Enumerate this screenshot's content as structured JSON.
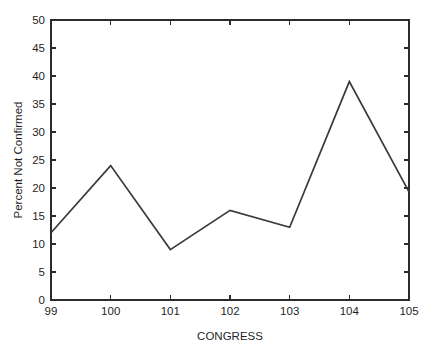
{
  "chart_data": {
    "type": "line",
    "title": "",
    "subtitle": "",
    "xlabel": "CONGRESS",
    "ylabel": "Percent Not Confirmed",
    "x": [
      99,
      100,
      101,
      102,
      103,
      104,
      105
    ],
    "values": [
      12,
      24,
      9,
      16,
      13,
      39,
      19.3
    ],
    "categories": [
      "99",
      "100",
      "101",
      "102",
      "103",
      "104",
      "105"
    ],
    "series": [
      {
        "name": "Percent Not Confirmed",
        "values": [
          12,
          24,
          9,
          16,
          13,
          39,
          19.3
        ]
      }
    ],
    "xlim": [
      99,
      105
    ],
    "ylim": [
      0,
      50
    ],
    "x_ticks": [
      99,
      100,
      101,
      102,
      103,
      104,
      105
    ],
    "x_tick_labels": [
      "99",
      "100",
      "101",
      "102",
      "103",
      "104",
      "105"
    ],
    "y_ticks": [
      0,
      5,
      10,
      15,
      20,
      25,
      30,
      35,
      40,
      45,
      50
    ],
    "y_tick_labels": [
      "0",
      "5",
      "10",
      "15",
      "20",
      "25",
      "30",
      "35",
      "40",
      "45",
      "50"
    ],
    "grid": false,
    "legend": false,
    "legend_position": "none",
    "line_color": "#3a3a3a",
    "axis_color": "#2b2b2b",
    "background_color": "#ffffff",
    "annotations": []
  },
  "axis": {
    "x_title": "CONGRESS",
    "y_title": "Percent Not Confirmed"
  },
  "y_labels": {
    "t0": "0",
    "t1": "5",
    "t2": "10",
    "t3": "15",
    "t4": "20",
    "t5": "25",
    "t6": "30",
    "t7": "35",
    "t8": "40",
    "t9": "45",
    "t10": "50"
  },
  "x_labels": {
    "t0": "99",
    "t1": "100",
    "t2": "101",
    "t3": "102",
    "t4": "103",
    "t5": "104",
    "t6": "105"
  }
}
